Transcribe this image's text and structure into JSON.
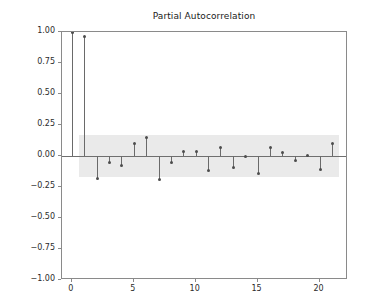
{
  "chart_data": {
    "type": "bar",
    "subtype": "stem-correlogram",
    "title": "Partial Autocorrelation",
    "xlabel": "",
    "ylabel": "",
    "x": [
      0,
      1,
      2,
      3,
      4,
      5,
      6,
      7,
      8,
      9,
      10,
      11,
      12,
      13,
      14,
      15,
      16,
      17,
      18,
      19,
      20,
      21
    ],
    "values": [
      1.0,
      0.96,
      -0.18,
      -0.05,
      -0.08,
      0.1,
      0.15,
      -0.19,
      -0.05,
      0.04,
      0.035,
      -0.12,
      0.07,
      -0.09,
      -0.005,
      -0.14,
      0.07,
      0.03,
      -0.035,
      0.005,
      -0.11,
      0.1
    ],
    "series": [
      {
        "name": "Partial autocorrelation",
        "values": [
          1.0,
          0.96,
          -0.18,
          -0.05,
          -0.08,
          0.1,
          0.15,
          -0.19,
          -0.05,
          0.04,
          0.035,
          -0.12,
          0.07,
          -0.09,
          -0.005,
          -0.14,
          0.07,
          0.03,
          -0.035,
          0.005,
          -0.11,
          0.1
        ]
      }
    ],
    "confidence_band": {
      "upper": 0.17,
      "lower": -0.17,
      "x_start": 0.6,
      "x_end": 21.6,
      "color": "#eaeaea"
    },
    "xlim": [
      -0.8,
      22.3
    ],
    "ylim": [
      -1.0,
      1.0
    ],
    "xticks": [
      0,
      5,
      10,
      15,
      20
    ],
    "xticklabels": [
      "0",
      "5",
      "10",
      "15",
      "20"
    ],
    "yticks": [
      1.0,
      0.75,
      0.5,
      0.25,
      0.0,
      -0.25,
      -0.5,
      -0.75,
      -1.0
    ],
    "yticklabels": [
      "1.00",
      "0.75",
      "0.50",
      "0.25",
      "0.00",
      "−0.25",
      "−0.50",
      "−0.75",
      "−1.00"
    ],
    "grid": false,
    "legend": null,
    "zero_line_color": "#6f6f6f",
    "stem_color": "#6a6a6a",
    "marker_color": "#4d4d4d",
    "frame_color": "#8a8a8a",
    "background": "#ffffff"
  }
}
